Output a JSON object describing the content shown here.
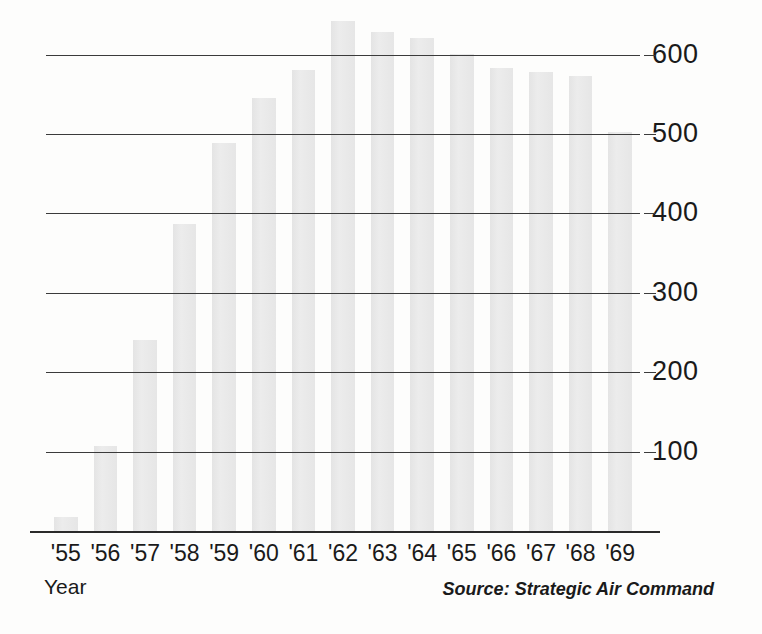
{
  "chart_data": {
    "type": "bar",
    "title": "",
    "xlabel": "Year",
    "ylabel": "",
    "ylim": [
      0,
      680
    ],
    "grid": true,
    "legend": "none",
    "yticks": [
      100,
      200,
      300,
      400,
      500,
      600
    ],
    "ytick_labels": [
      "100",
      "200",
      "300",
      "400",
      "500",
      "600"
    ],
    "categories": [
      "'55",
      "'56",
      "'57",
      "'58",
      "'59",
      "'60",
      "'61",
      "'62",
      "'63",
      "'64",
      "'65",
      "'66",
      "'67",
      "'68",
      "'69"
    ],
    "values": [
      18,
      107,
      241,
      387,
      489,
      545,
      581,
      642,
      629,
      621,
      601,
      583,
      578,
      573,
      502
    ],
    "bar_color": "#e7e7e7",
    "axis_color": "#2a2a2a",
    "annotations": []
  },
  "axis": {
    "x_title": "Year"
  },
  "source": {
    "text": "Source: Strategic Air Command"
  }
}
